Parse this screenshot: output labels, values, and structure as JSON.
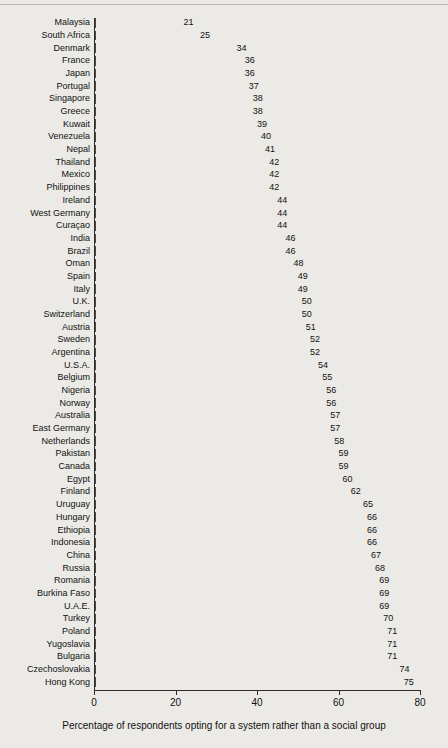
{
  "chart_data": {
    "type": "bar",
    "orientation": "horizontal",
    "title": "",
    "xlabel": "Percentage of respondents opting for a system rather than a social group",
    "ylabel": "",
    "xlim": [
      0,
      80
    ],
    "xticks": [
      0,
      20,
      40,
      60,
      80
    ],
    "xtick_labels": [
      "0",
      "20",
      "40",
      "60",
      "80"
    ],
    "grid": false,
    "legend": null,
    "bar_color": "#a6a4a0",
    "bar_edge_color": "#4a4845",
    "background_color": "#eceae6",
    "value_labels_shown": true,
    "categories": [
      "Malaysia",
      "South Africa",
      "Denmark",
      "France",
      "Japan",
      "Portugal",
      "Singapore",
      "Greece",
      "Kuwait",
      "Venezuela",
      "Nepal",
      "Thailand",
      "Mexico",
      "Philippines",
      "Ireland",
      "West Germany",
      "Curaçao",
      "India",
      "Brazil",
      "Oman",
      "Spain",
      "Italy",
      "U.K.",
      "Switzerland",
      "Austria",
      "Sweden",
      "Argentina",
      "U.S.A.",
      "Belgium",
      "Nigeria",
      "Norway",
      "Australia",
      "East Germany",
      "Netherlands",
      "Pakistan",
      "Canada",
      "Egypt",
      "Finland",
      "Uruguay",
      "Hungary",
      "Ethiopia",
      "Indonesia",
      "China",
      "Russia",
      "Romania",
      "Burkina Faso",
      "U.A.E.",
      "Turkey",
      "Poland",
      "Yugoslavia",
      "Bulgaria",
      "Czechoslovakia",
      "Hong Kong"
    ],
    "values": [
      21,
      25,
      34,
      36,
      36,
      37,
      38,
      38,
      39,
      40,
      41,
      42,
      42,
      42,
      44,
      44,
      44,
      46,
      46,
      48,
      49,
      49,
      50,
      50,
      51,
      52,
      52,
      54,
      55,
      56,
      56,
      57,
      57,
      58,
      59,
      59,
      60,
      62,
      65,
      66,
      66,
      66,
      67,
      68,
      69,
      69,
      69,
      70,
      71,
      71,
      71,
      74,
      75
    ]
  }
}
